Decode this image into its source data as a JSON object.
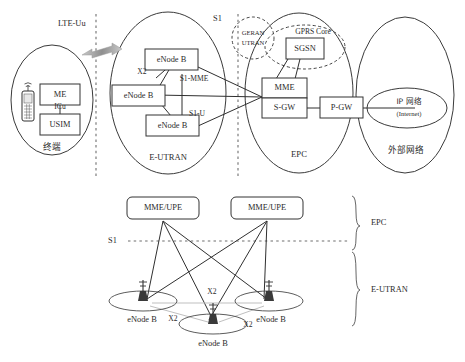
{
  "diagram": {
    "colors": {
      "background": "#ffffff",
      "stroke": "#333333",
      "dashed": "#6f6f6f",
      "pale_link": "#b8b8b8",
      "arrow": "#9a9a9a"
    }
  },
  "upper": {
    "interfaces": {
      "lte_uu": "LTE-Uu",
      "s1": "S1",
      "x2": "X2",
      "s1_mme": "S1-MME",
      "s1_u": "S1-U",
      "icu": "ICu"
    },
    "zones": [
      {
        "id": "ue",
        "label": "终端"
      },
      {
        "id": "eutran",
        "label": "E-UTRAN"
      },
      {
        "id": "epc",
        "label": "EPC"
      },
      {
        "id": "external",
        "label": "外部网络"
      }
    ],
    "ue": {
      "me": "ME",
      "usim": "USIM",
      "phone_icon": "mobile-phone-icon"
    },
    "eutran": {
      "nodes": [
        {
          "id": "enb-top",
          "label": "eNode B"
        },
        {
          "id": "enb-mid",
          "label": "eNode B"
        },
        {
          "id": "enb-bot",
          "label": "eNode B"
        }
      ]
    },
    "legacy": {
      "label_line1": "GERAN",
      "label_line2": "UTRAN",
      "gprs_core": "GPRS Core",
      "sgsn": "SGSN"
    },
    "epc": {
      "mme": "MME",
      "sgw": "S-GW",
      "pgw": "P-GW"
    },
    "external": {
      "ip_line1": "IP 网络",
      "ip_line2": "(Internet)"
    }
  },
  "lower": {
    "core_nodes": [
      {
        "id": "mme-upe-left",
        "label": "MME/UPE"
      },
      {
        "id": "mme-upe-right",
        "label": "MME/UPE"
      }
    ],
    "s1_label": "S1",
    "x2_labels": [
      "X2",
      "X2",
      "X2"
    ],
    "base_stations": [
      {
        "id": "enb-left",
        "label": "eNode B"
      },
      {
        "id": "enb-center",
        "label": "eNode B"
      },
      {
        "id": "enb-right",
        "label": "eNode B"
      }
    ],
    "brackets": [
      {
        "id": "bracket-epc",
        "label": "EPC"
      },
      {
        "id": "bracket-eutran",
        "label": "E-UTRAN"
      }
    ]
  }
}
